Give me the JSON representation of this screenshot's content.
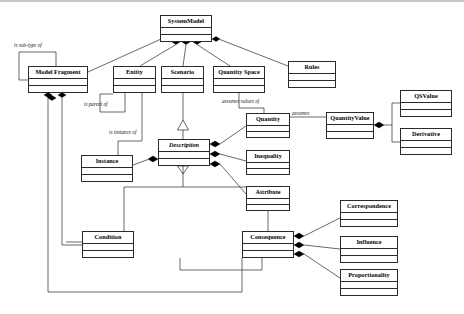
{
  "diagram": {
    "type": "uml-class-diagram",
    "title": "",
    "background": "#ffffff",
    "stroke_color": "#2a2a2a",
    "text_color": "#000000",
    "classes": [
      {
        "id": "systemmodel",
        "name": "SystemModel",
        "abstract": false,
        "x": 160,
        "y": 13,
        "w": 52,
        "h": 27
      },
      {
        "id": "modelfragment",
        "name": "Model Fragment",
        "abstract": false,
        "x": 28,
        "y": 64,
        "w": 60,
        "h": 27
      },
      {
        "id": "entity",
        "name": "Entity",
        "abstract": false,
        "x": 113,
        "y": 64,
        "w": 43,
        "h": 27
      },
      {
        "id": "scenario",
        "name": "Scenario",
        "abstract": false,
        "x": 161,
        "y": 64,
        "w": 43,
        "h": 27
      },
      {
        "id": "quantityspace",
        "name": "Quantity Space",
        "abstract": false,
        "x": 213,
        "y": 64,
        "w": 52,
        "h": 27
      },
      {
        "id": "rules",
        "name": "Rules",
        "abstract": false,
        "x": 288,
        "y": 59,
        "w": 48,
        "h": 27
      },
      {
        "id": "qsvalue",
        "name": "QSValue",
        "abstract": false,
        "x": 400,
        "y": 88,
        "w": 52,
        "h": 27
      },
      {
        "id": "derivative",
        "name": "Derivative",
        "abstract": false,
        "x": 400,
        "y": 126,
        "w": 52,
        "h": 27
      },
      {
        "id": "quantityvalue",
        "name": "QuantityValue",
        "abstract": false,
        "x": 326,
        "y": 110,
        "w": 48,
        "h": 27
      },
      {
        "id": "quantity",
        "name": "Quantity",
        "abstract": false,
        "x": 246,
        "y": 111,
        "w": 44,
        "h": 25
      },
      {
        "id": "inequality",
        "name": "Inequality",
        "abstract": false,
        "x": 246,
        "y": 148,
        "w": 44,
        "h": 25
      },
      {
        "id": "attribute",
        "name": "Attribute",
        "abstract": false,
        "x": 246,
        "y": 184,
        "w": 44,
        "h": 25
      },
      {
        "id": "description",
        "name": "Description",
        "abstract": true,
        "x": 158,
        "y": 137,
        "w": 52,
        "h": 27
      },
      {
        "id": "instance",
        "name": "Instance",
        "abstract": false,
        "x": 81,
        "y": 153,
        "w": 52,
        "h": 27
      },
      {
        "id": "condition",
        "name": "Condition",
        "abstract": false,
        "x": 82,
        "y": 229,
        "w": 52,
        "h": 27
      },
      {
        "id": "consequence",
        "name": "Consequence",
        "abstract": false,
        "x": 242,
        "y": 229,
        "w": 52,
        "h": 27
      },
      {
        "id": "correspondence",
        "name": "Correspondence",
        "abstract": false,
        "x": 340,
        "y": 198,
        "w": 58,
        "h": 27
      },
      {
        "id": "influence",
        "name": "Influence",
        "abstract": false,
        "x": 340,
        "y": 234,
        "w": 58,
        "h": 27
      },
      {
        "id": "proportionality",
        "name": "Proportionality",
        "abstract": false,
        "x": 340,
        "y": 267,
        "w": 58,
        "h": 27
      }
    ],
    "edge_labels": [
      {
        "id": "lbl-subtype",
        "text": "is sub-type of",
        "x": 14,
        "y": 41
      },
      {
        "id": "lbl-parentof",
        "text": "is parent of",
        "x": 84,
        "y": 100
      },
      {
        "id": "lbl-instanceof",
        "text": "is instance of",
        "x": 109,
        "y": 128
      },
      {
        "id": "lbl-assumesvals",
        "text": "assumes values of",
        "x": 222,
        "y": 97
      },
      {
        "id": "lbl-assumes",
        "text": "assumes",
        "x": 292,
        "y": 109
      }
    ]
  }
}
